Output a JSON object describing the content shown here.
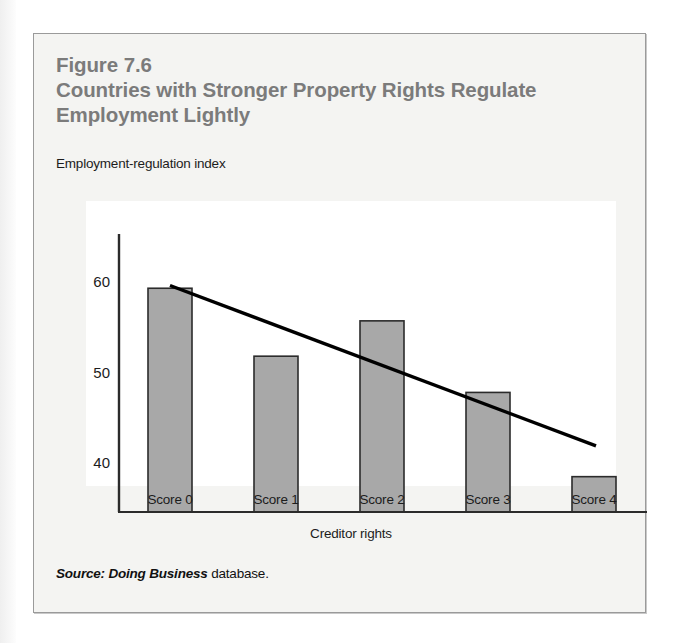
{
  "figure": {
    "number": "Figure 7.6",
    "title": "Countries with Stronger Property Rights Regulate Employment Lightly",
    "source_emphasis": "Source: Doing Business",
    "source_rest": " database."
  },
  "colors": {
    "bar_fill": "#a8a8a8",
    "bar_stroke": "#2b2b2b",
    "trendline": "#000000",
    "axis": "#2b2b2b",
    "title_text": "#7b7b7b",
    "body_text": "#1c1c1c",
    "figure_background": "#f4f4f2",
    "plot_background": "#ffffff",
    "figure_border": "#9a9a9a"
  },
  "chart_data": {
    "type": "bar",
    "title": "Countries with Stronger Property Rights Regulate Employment Lightly",
    "subtitle": "Figure 7.6",
    "categories": [
      "Score 0",
      "Score 1",
      "Score 2",
      "Score 3",
      "Score 4"
    ],
    "values": [
      59.2,
      51.7,
      55.6,
      47.7,
      38.4
    ],
    "series": [
      {
        "name": "Employment-regulation index",
        "values": [
          59.2,
          51.7,
          55.6,
          47.7,
          38.4
        ]
      }
    ],
    "trendline": {
      "type": "linear",
      "x_start": "Score 0",
      "x_end": "Score 4",
      "y_start": 59.5,
      "y_end": 41.8
    },
    "xlabel": "Creditor rights",
    "ylabel": "Employment-regulation index",
    "ylim": [
      34.5,
      63.5
    ],
    "yticks": [
      40,
      50,
      60
    ],
    "ytick_labels": [
      "40",
      "50",
      "60"
    ],
    "grid": false,
    "legend": false
  }
}
